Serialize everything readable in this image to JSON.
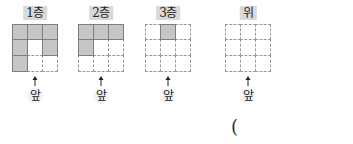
{
  "panels": [
    {
      "label": "1층",
      "cells": [
        1,
        1,
        1,
        1,
        0,
        1,
        1,
        0,
        0
      ],
      "front_label": "앞"
    },
    {
      "label": "2층",
      "cells": [
        1,
        1,
        1,
        1,
        0,
        0,
        0,
        0,
        0
      ],
      "front_label": "앞"
    },
    {
      "label": "3층",
      "cells": [
        0,
        1,
        0,
        0,
        0,
        0,
        0,
        0,
        0
      ],
      "front_label": "앞"
    },
    {
      "label": "위",
      "cells": [
        0,
        0,
        0,
        0,
        0,
        0,
        0,
        0,
        0
      ],
      "front_label": "앞"
    }
  ],
  "answer_paren": "(",
  "colors": {
    "filled": "#c6c6c6",
    "filled_border": "#7d7d7d",
    "dashed_border": "#9a9a9a",
    "label_bg": "#d9d9d9"
  }
}
